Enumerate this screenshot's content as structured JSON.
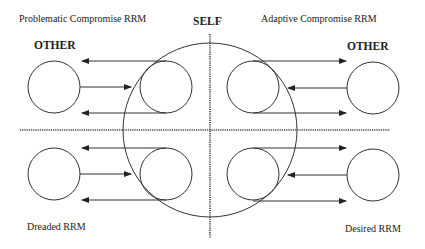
{
  "diagram": {
    "labels": {
      "self": "SELF",
      "other_left": "OTHER",
      "other_right": "OTHER",
      "quadrant_top_left": "Problematic Compromise RRM",
      "quadrant_top_right": "Adaptive Compromise RRM",
      "quadrant_bottom_left": "Dreaded RRM",
      "quadrant_bottom_right": "Desired RRM"
    },
    "colors": {
      "stroke": "#333333",
      "text": "#222222",
      "background": "#ffffff"
    },
    "quadrants": [
      {
        "name": "Problematic Compromise RRM",
        "position": "top-left",
        "arrows": [
          "self-to-other",
          "other-to-self",
          "self-to-other"
        ]
      },
      {
        "name": "Adaptive Compromise RRM",
        "position": "top-right",
        "arrows": [
          "self-to-other",
          "other-to-self",
          "self-to-other"
        ]
      },
      {
        "name": "Dreaded RRM",
        "position": "bottom-left",
        "arrows": [
          "self-to-other",
          "other-to-self",
          "self-to-other"
        ]
      },
      {
        "name": "Desired RRM",
        "position": "bottom-right",
        "arrows": [
          "self-to-other",
          "other-to-self",
          "self-to-other"
        ]
      }
    ]
  }
}
